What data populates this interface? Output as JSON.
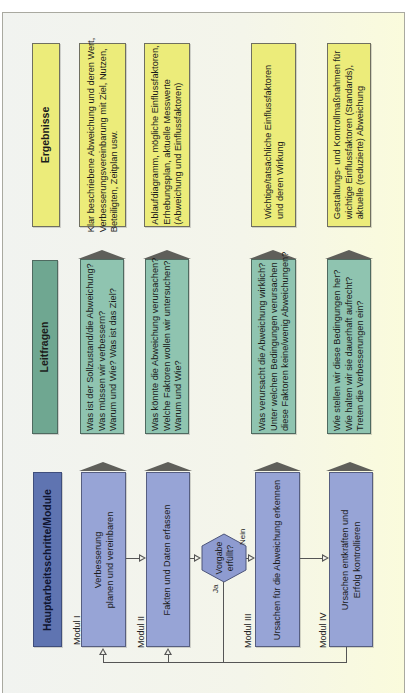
{
  "rows": {
    "ergebnisse": {
      "header": "Ergebnisse",
      "items": [
        [
          "Klar beschriebene Abweichung und deren Wert,",
          "Verbesserungsvereinbarung mit Ziel, Nutzen,",
          "Beteiligten, Zeitplan usw."
        ],
        [
          "Ablaufdiagramm,  mögliche Einflussfaktoren,",
          "Erhebungsplan, aktuelle Messwerte",
          "(Abweichung und Einflussfaktoren)"
        ],
        [
          "Wichtige/tatsächliche Einflussfaktoren",
          "und deren Wirkung"
        ],
        [
          "Gestaltungs- und Kontrollmaßnahmen für",
          "wichtige Einflussfaktoren (Standards),",
          "aktuelle (reduzierte) Abweichung"
        ]
      ]
    },
    "leitfragen": {
      "header": "Leitfragen",
      "items": [
        [
          "Was ist der Sollzustand/die Abweichung?",
          "Was müssen wir verbessern?",
          "Warum und Wie? Was ist das Ziel?"
        ],
        [
          "Was könnte die Abweichung verursachen?",
          "Welche Faktoren wollen wir untersuchen?",
          "Warum und Wie?"
        ],
        [
          "Was verursacht die Abweichung wirklich?",
          "Unter welchen Bedingungen verursachen",
          "diese Faktoren keine/wenig Abweichungen?"
        ],
        [
          "Wie stellen wir diese Bedingungen her?",
          "Wie halten wir sie dauerhaft aufrecht?",
          "Treten die Verbesserungen ein?"
        ]
      ]
    },
    "hauptarbeitsschritte": {
      "header": "Hauptarbeitsschritte/Module",
      "items": [
        [
          "Verbesserung",
          "planen und vereinbaren"
        ],
        [
          "Fakten und Daten erfassen"
        ],
        [
          "Ursachen für die Abweichung erkennen"
        ],
        [
          "Ursachen entkräften und",
          "Erfolg kontrollieren"
        ]
      ],
      "module_labels": [
        "Modul I",
        "Modul II",
        "Modul III",
        "Modul IV"
      ]
    }
  },
  "decision": {
    "lines": [
      "Vorgabe",
      "erfüllt?"
    ],
    "yes_label": "Ja",
    "no_label": "Nein"
  },
  "colors": {
    "ergebnisse": "#ecec7a",
    "leitfragen": "#8fc4b0",
    "leitfragen_header": "#6fa791",
    "module": "#97a4d6",
    "module_header": "#5f74b1"
  }
}
